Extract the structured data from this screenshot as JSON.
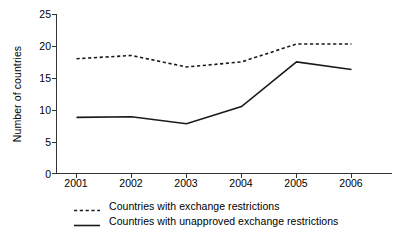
{
  "chart_data": {
    "type": "line",
    "title": "",
    "xlabel": "",
    "ylabel": "Number of countries",
    "categories": [
      "2001",
      "2002",
      "2003",
      "2004",
      "2005",
      "2006"
    ],
    "x": [
      2001,
      2002,
      2003,
      2004,
      2005,
      2006
    ],
    "ylim": [
      0,
      25
    ],
    "yticks": [
      0,
      5,
      10,
      15,
      20,
      25
    ],
    "ytick_labels": [
      "0",
      "5",
      "10",
      "15",
      "20",
      "25"
    ],
    "grid": false,
    "legend_position": "below-axis-left",
    "series": [
      {
        "name": "Countries with exchange restrictions",
        "style": "dashed",
        "color": "#1a1a1a",
        "values": [
          18.0,
          18.5,
          16.7,
          17.5,
          20.3,
          20.3
        ]
      },
      {
        "name": "Countries with unapproved exchange restrictions",
        "style": "solid",
        "color": "#1a1a1a",
        "values": [
          8.8,
          8.9,
          7.8,
          10.5,
          17.5,
          16.3
        ]
      }
    ]
  },
  "axes": {
    "y_title": "Number of countries",
    "y_ticks": [
      "25",
      "20",
      "15",
      "10",
      "5",
      "0"
    ],
    "x_ticks": [
      "2001",
      "2002",
      "2003",
      "2004",
      "2005",
      "2006"
    ]
  },
  "legend": {
    "items": [
      {
        "label": "Countries with exchange restrictions",
        "marker": "dashed-line-swatch"
      },
      {
        "label": "Countries with unapproved exchange restrictions",
        "marker": "solid-line-swatch"
      }
    ]
  }
}
